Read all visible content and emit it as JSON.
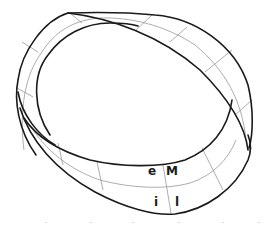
{
  "figure": {
    "colors": {
      "background": "#ffffff",
      "edge_stroke": "#1a1a1a",
      "grid_stroke": "#8a8a8a",
      "label_fill": "#1a1a1a"
    },
    "labels": [
      {
        "id": "e",
        "text": "e"
      },
      {
        "id": "M",
        "text": "M"
      },
      {
        "id": "i",
        "text": "i"
      },
      {
        "id": "l",
        "text": "l"
      }
    ]
  }
}
